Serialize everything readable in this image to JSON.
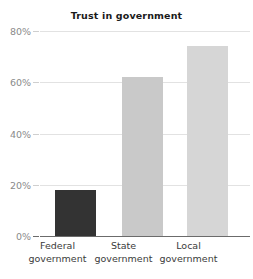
{
  "chart_data": {
    "type": "bar",
    "title": "Trust in government",
    "xlabel": "",
    "ylabel": "",
    "categories": [
      "Federal government",
      "State government",
      "Local government"
    ],
    "category_lines": [
      [
        "Federal",
        "government"
      ],
      [
        "State",
        "government"
      ],
      [
        "Local",
        "government"
      ]
    ],
    "values": [
      18,
      62,
      74
    ],
    "value_labels": [
      "18%",
      "62%",
      "74%"
    ],
    "ylim": [
      0,
      80
    ],
    "yticks": [
      0,
      20,
      40,
      60,
      80
    ],
    "ytick_labels": [
      "0%",
      "20%",
      "40%",
      "60%",
      "80%"
    ],
    "grid": true,
    "grid_axis": "y",
    "legend": false,
    "legend_position": "none",
    "bar_colors": [
      "#333333",
      "#c9c9c9",
      "#d6d6d6"
    ],
    "grid_color": "#e2e2e2",
    "axis_color": "#6b6b6b",
    "ytick_label_color": "#8a8a8a",
    "xtick_label_color": "#3b3b3b",
    "title_color": "#1a1a1a",
    "background": "#ffffff"
  }
}
